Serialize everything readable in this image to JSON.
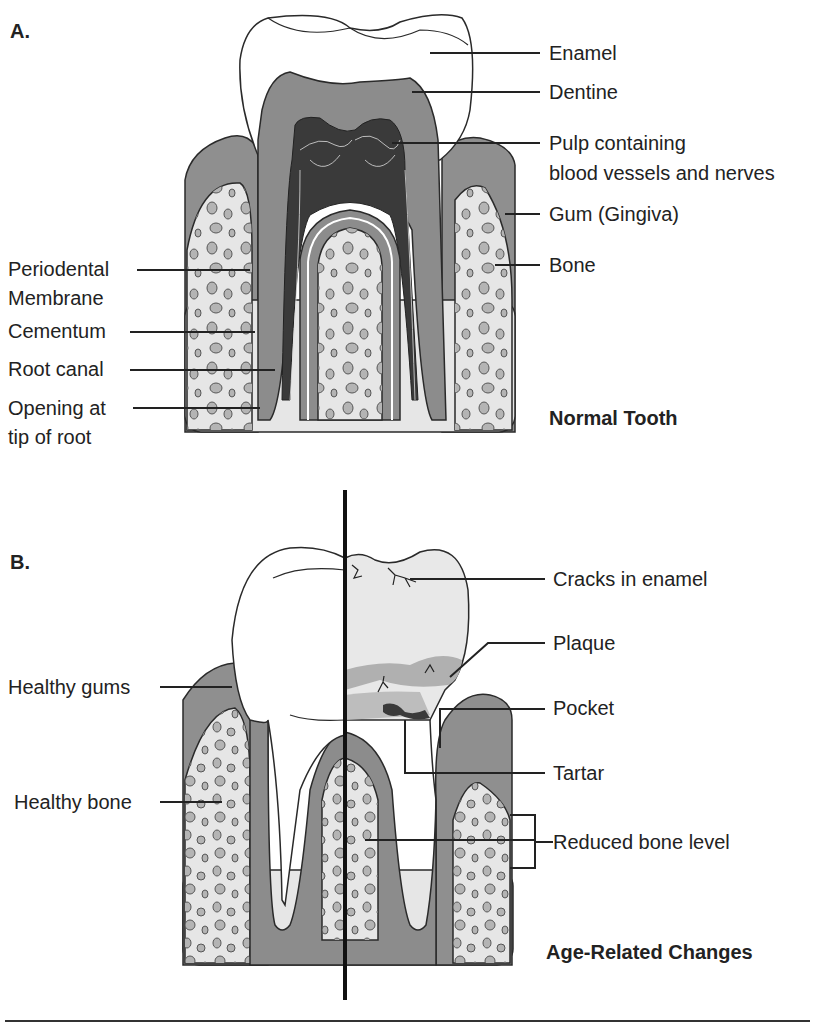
{
  "panel_a": {
    "letter": "A.",
    "caption": "Normal Tooth",
    "labels_right": {
      "enamel": "Enamel",
      "dentine": "Dentine",
      "pulp_line1": "Pulp containing",
      "pulp_line2": "blood vessels and nerves",
      "gum": "Gum (Gingiva)",
      "bone": "Bone"
    },
    "labels_left": {
      "periodontal_line1": "Periodental",
      "periodontal_line2": "Membrane",
      "cementum": "Cementum",
      "root_canal": "Root canal",
      "opening_line1": "Opening at",
      "opening_line2": "tip of root"
    }
  },
  "panel_b": {
    "letter": "B.",
    "caption": "Age-Related Changes",
    "labels_left": {
      "healthy_gums": "Healthy gums",
      "healthy_bone": "Healthy bone"
    },
    "labels_right": {
      "cracks": "Cracks in enamel",
      "plaque": "Plaque",
      "pocket": "Pocket",
      "tartar": "Tartar",
      "reduced_bone": "Reduced bone level"
    }
  },
  "colors": {
    "enamel": "#ffffff",
    "dentine": "#8c8c8c",
    "pulp": "#3a3a3a",
    "gum": "#8f8f8f",
    "bone": "#e6e6e6",
    "bone_chips": "#b4b4b4",
    "outline": "#2a2a2a"
  }
}
